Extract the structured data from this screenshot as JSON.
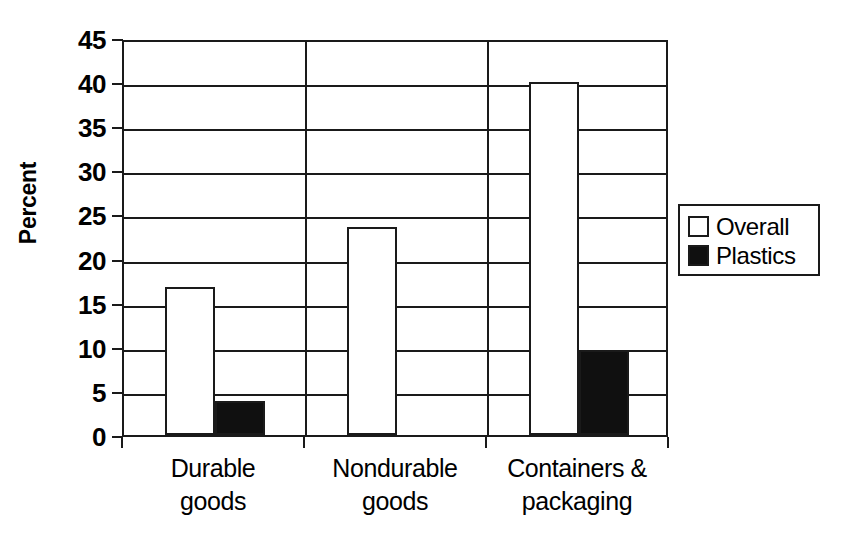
{
  "chart_data": {
    "type": "bar",
    "title": "",
    "xlabel": "",
    "ylabel": "Percent",
    "ylim": [
      0,
      45
    ],
    "ytick_step": 5,
    "yticks": [
      0,
      5,
      10,
      15,
      20,
      25,
      30,
      35,
      40,
      45
    ],
    "ytick_labels": [
      "0",
      "5",
      "10",
      "15",
      "20",
      "25",
      "30",
      "35",
      "40",
      "45"
    ],
    "grid": true,
    "grid_axis": "y",
    "legend_position": "right",
    "categories": [
      "Durable goods",
      "Nondurable goods",
      "Containers & packaging"
    ],
    "category_label_lines": [
      [
        "Durable",
        "goods"
      ],
      [
        "Nondurable",
        "goods"
      ],
      [
        "Containers &",
        "packaging"
      ]
    ],
    "series": [
      {
        "name": "Overall",
        "color": "#ffffff",
        "values": [
          16.8,
          23.6,
          40.0
        ]
      },
      {
        "name": "Plastics",
        "color": "#101010",
        "values": [
          3.8,
          0,
          9.6
        ]
      }
    ]
  },
  "legend": {
    "items": [
      {
        "label": "Overall"
      },
      {
        "label": "Plastics"
      }
    ]
  },
  "axis": {
    "y_title": "Percent"
  },
  "colors": {
    "ink": "#1a1a1a",
    "overall_fill": "#ffffff",
    "plastics_fill": "#101010",
    "background": "#ffffff"
  }
}
